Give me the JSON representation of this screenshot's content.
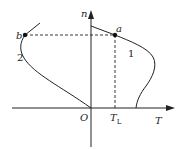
{
  "diagram": {
    "axes": {
      "x_label": "T",
      "y_label": "n",
      "origin_label": "O"
    },
    "tick": {
      "main": "T",
      "subscript": "L"
    },
    "points": [
      {
        "id": "a",
        "label": "a"
      },
      {
        "id": "b",
        "label": "b"
      }
    ],
    "curves": [
      {
        "id": "curve-1",
        "label": "1"
      },
      {
        "id": "curve-2",
        "label": "2"
      }
    ],
    "colors": {
      "line": "#222222",
      "background": "#ffffff"
    }
  }
}
